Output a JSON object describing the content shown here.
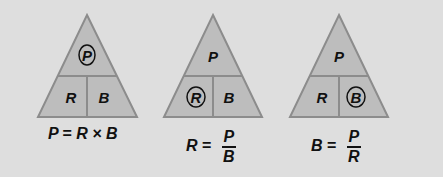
{
  "colors": {
    "background": "#dedede",
    "triangle_fill": "#bdbdbd",
    "triangle_stroke": "#8c8c8c",
    "text": "#111111"
  },
  "triangles": [
    {
      "top": "P",
      "bottom_left": "R",
      "bottom_right": "B",
      "circled": "P",
      "formula": {
        "lhs": "P",
        "eq": "=",
        "rhs": "R × B"
      }
    },
    {
      "top": "P",
      "bottom_left": "R",
      "bottom_right": "B",
      "circled": "R",
      "formula": {
        "lhs": "R",
        "eq": "=",
        "num": "P",
        "den": "B"
      }
    },
    {
      "top": "P",
      "bottom_left": "R",
      "bottom_right": "B",
      "circled": "B",
      "formula": {
        "lhs": "B",
        "eq": "=",
        "num": "P",
        "den": "R"
      }
    }
  ]
}
